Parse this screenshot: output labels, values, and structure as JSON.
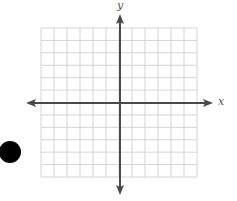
{
  "figure": {
    "type": "coordinate-plane",
    "grid": {
      "columns": 12,
      "rows": 12,
      "x_left": 41,
      "x_right": 197,
      "y_top": 28,
      "y_bottom": 177,
      "line_color": "#d4d4d4"
    },
    "x_axis": {
      "label": "x",
      "y_position": 103,
      "x_start": 26,
      "x_end": 213,
      "color": "#4a4a4a"
    },
    "y_axis": {
      "label": "y",
      "x_position": 120,
      "y_start": 14,
      "y_end": 195,
      "color": "#4a4a4a"
    },
    "marker": {
      "shape": "filled-circle",
      "color": "#000000",
      "cx": 10,
      "cy": 152,
      "r": 11
    }
  }
}
